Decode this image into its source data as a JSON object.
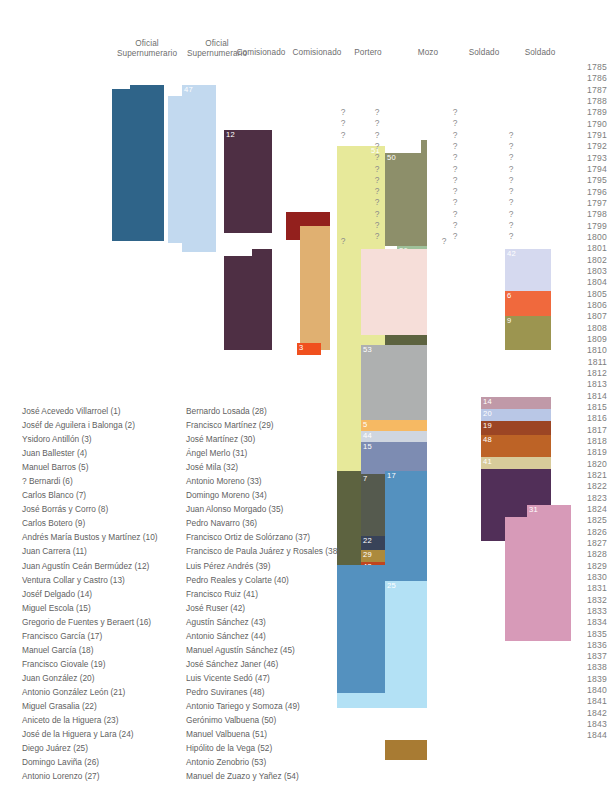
{
  "figure": {
    "type": "timeline-gantt",
    "year_axis": {
      "start": 1785,
      "end": 1844,
      "labels": [
        "1785",
        "1786",
        "1787",
        "1788",
        "1789",
        "1790",
        "1791",
        "1792",
        "1793",
        "1794",
        "1795",
        "1796",
        "1797",
        "1798",
        "1799",
        "1800",
        "1801",
        "1802",
        "1803",
        "1804",
        "1805",
        "1806",
        "1807",
        "1808",
        "1809",
        "1810",
        "1811",
        "1812",
        "1813",
        "1814",
        "1815",
        "1816",
        "1817",
        "1818",
        "1819",
        "1820",
        "1821",
        "1822",
        "1823",
        "1824",
        "1825",
        "1826",
        "1827",
        "1828",
        "1829",
        "1830",
        "1831",
        "1832",
        "1833",
        "1834",
        "1835",
        "1836",
        "1837",
        "1838",
        "1839",
        "1840",
        "1841",
        "1842",
        "1843",
        "1844"
      ]
    },
    "columns": [
      {
        "label": "Oficial\nSupernumerario"
      },
      {
        "label": "Oficial\nSupernumerario"
      },
      {
        "label": "Comisionado"
      },
      {
        "label": "Comisionado"
      },
      {
        "label": "Portero"
      },
      {
        "label": "Mozo"
      },
      {
        "label": "Soldado"
      },
      {
        "label": "Soldado"
      }
    ],
    "unknown_symbol": "?",
    "bars": [
      {
        "id": "36",
        "label": "36",
        "color": "#2f6489",
        "x": 112,
        "y": 89,
        "w": 52,
        "h": 152,
        "tx": 18,
        "ty": -7
      },
      {
        "id": "36b",
        "label": "",
        "color": "#2f6489",
        "x": 130,
        "y": 85,
        "w": 34,
        "h": 8,
        "tx": 0,
        "ty": 0
      },
      {
        "id": "47",
        "label": "47",
        "color": "#c2d9ef",
        "x": 182,
        "y": 85,
        "w": 34,
        "h": 167,
        "tx": 2,
        "ty": 0
      },
      {
        "id": "47b",
        "label": "",
        "color": "#c2d9ef",
        "x": 168,
        "y": 96,
        "w": 48,
        "h": 147,
        "tx": 0,
        "ty": 0
      },
      {
        "id": "12",
        "label": "12",
        "color": "#4e2f44",
        "x": 224,
        "y": 130,
        "w": 48,
        "h": 103,
        "tx": 2,
        "ty": 0
      },
      {
        "id": "12b",
        "label": "",
        "color": "#4e2f44",
        "x": 224,
        "y": 256,
        "w": 48,
        "h": 94,
        "tx": 0,
        "ty": 0
      },
      {
        "id": "12c",
        "label": "",
        "color": "#4e2f44",
        "x": 252,
        "y": 249,
        "w": 20,
        "h": 14,
        "tx": 0,
        "ty": 0
      },
      {
        "id": "1",
        "label": "1",
        "color": "#93201d",
        "x": 286,
        "y": 212,
        "w": 44,
        "h": 14,
        "tx": 2,
        "ty": 0
      },
      {
        "id": "1b",
        "label": "",
        "color": "#93201d",
        "x": 286,
        "y": 212,
        "w": 17,
        "h": 28,
        "tx": 0,
        "ty": 0
      },
      {
        "id": "49",
        "label": "49",
        "color": "#e0b071",
        "x": 300,
        "y": 226,
        "w": 30,
        "h": 124,
        "tx": 6,
        "ty": 0
      },
      {
        "id": "49b",
        "label": "",
        "color": "#e0b071",
        "x": 300,
        "y": 226,
        "w": 30,
        "h": 124,
        "tx": 0,
        "ty": 0
      },
      {
        "id": "3",
        "label": "3",
        "color": "#f0501e",
        "x": 297,
        "y": 343,
        "w": 24,
        "h": 12,
        "tx": 2,
        "ty": 0
      },
      {
        "id": "51",
        "label": "51",
        "color": "#e7e99a",
        "x": 337,
        "y": 146,
        "w": 48,
        "h": 327,
        "tx": 34,
        "ty": 0
      },
      {
        "id": "51b",
        "label": "",
        "color": "#e7e99a",
        "x": 337,
        "y": 153,
        "w": 26,
        "h": 320,
        "tx": 0,
        "ty": 0
      },
      {
        "id": "50",
        "label": "50",
        "color": "#8d8f6a",
        "x": 385,
        "y": 153,
        "w": 42,
        "h": 93,
        "tx": 2,
        "ty": 0
      },
      {
        "id": "50b",
        "label": "",
        "color": "#8d8f6a",
        "x": 421,
        "y": 140,
        "w": 6,
        "h": 14,
        "tx": 0,
        "ty": 0
      },
      {
        "id": "18",
        "label": "18",
        "color": "#9e3a76",
        "x": 385,
        "y": 252,
        "w": 12,
        "h": 12,
        "tx": 1,
        "ty": 0
      },
      {
        "id": "26",
        "label": "26",
        "color": "#9fc19a",
        "x": 397,
        "y": 246,
        "w": 30,
        "h": 34,
        "tx": 2,
        "ty": 0
      },
      {
        "id": "26b",
        "label": "",
        "color": "#9fc19a",
        "x": 385,
        "y": 263,
        "w": 42,
        "h": 18,
        "tx": 0,
        "ty": 0
      },
      {
        "id": "27",
        "label": "27",
        "color": "#5d6340",
        "x": 397,
        "y": 281,
        "w": 30,
        "h": 186,
        "tx": 2,
        "ty": 0
      },
      {
        "id": "27b",
        "label": "",
        "color": "#5d6340",
        "x": 385,
        "y": 290,
        "w": 42,
        "h": 177,
        "tx": 0,
        "ty": 0
      },
      {
        "id": "27c",
        "label": "",
        "color": "#5d6340",
        "x": 337,
        "y": 471,
        "w": 90,
        "h": 94,
        "tx": 0,
        "ty": 0
      },
      {
        "id": "53",
        "label": "53",
        "color": "#aeb0b0",
        "x": 361,
        "y": 345,
        "w": 66,
        "h": 75,
        "tx": 2,
        "ty": 0
      },
      {
        "id": "53b",
        "label": "",
        "color": "#f6ded9",
        "x": 361,
        "y": 249,
        "w": 66,
        "h": 86,
        "tx": 0,
        "ty": 0
      },
      {
        "id": "5",
        "label": "5",
        "color": "#f6b963",
        "x": 361,
        "y": 420,
        "w": 66,
        "h": 11,
        "tx": 2,
        "ty": 0
      },
      {
        "id": "44",
        "label": "44",
        "color": "#cfd6e0",
        "x": 361,
        "y": 431,
        "w": 66,
        "h": 11,
        "tx": 2,
        "ty": 0
      },
      {
        "id": "15",
        "label": "15",
        "color": "#7d8cb2",
        "x": 361,
        "y": 442,
        "w": 66,
        "h": 32,
        "tx": 2,
        "ty": 0
      },
      {
        "id": "7",
        "label": "7",
        "color": "#555a4e",
        "x": 361,
        "y": 474,
        "w": 66,
        "h": 75,
        "tx": 2,
        "ty": 0
      },
      {
        "id": "22",
        "label": "22",
        "color": "#384359",
        "x": 361,
        "y": 536,
        "w": 66,
        "h": 14,
        "tx": 2,
        "ty": 0
      },
      {
        "id": "29",
        "label": "29",
        "color": "#ac8a3d",
        "x": 361,
        "y": 550,
        "w": 66,
        "h": 12,
        "tx": 2,
        "ty": 0
      },
      {
        "id": "43",
        "label": "43",
        "color": "#c0451f",
        "x": 361,
        "y": 562,
        "w": 66,
        "h": 12,
        "tx": 2,
        "ty": 0
      },
      {
        "id": "30",
        "label": "30",
        "color": "#b6c0e0",
        "x": 361,
        "y": 574,
        "w": 66,
        "h": 11,
        "tx": 2,
        "ty": 0
      },
      {
        "id": "32",
        "label": "32",
        "color": "#6d3b41",
        "x": 361,
        "y": 585,
        "w": 66,
        "h": 52,
        "tx": 2,
        "ty": 0
      },
      {
        "id": "17",
        "label": "17",
        "color": "#5491bf",
        "x": 385,
        "y": 471,
        "w": 42,
        "h": 110,
        "tx": 2,
        "ty": 0
      },
      {
        "id": "17b",
        "label": "",
        "color": "#5491bf",
        "x": 337,
        "y": 565,
        "w": 90,
        "h": 130,
        "tx": 0,
        "ty": 0
      },
      {
        "id": "17c",
        "label": "",
        "color": "#5491bf",
        "x": 337,
        "y": 565,
        "w": 48,
        "h": 140,
        "tx": 0,
        "ty": 0
      },
      {
        "id": "25",
        "label": "25",
        "color": "#b3e1f5",
        "x": 385,
        "y": 581,
        "w": 42,
        "h": 127,
        "tx": 2,
        "ty": 0
      },
      {
        "id": "25b",
        "label": "",
        "color": "#b3e1f5",
        "x": 337,
        "y": 693,
        "w": 90,
        "h": 15,
        "tx": 0,
        "ty": 0
      },
      {
        "id": "4",
        "label": "4",
        "color": "#a87b33",
        "x": 385,
        "y": 740,
        "w": 42,
        "h": 20,
        "tx": 22,
        "ty": 0
      },
      {
        "id": "4b",
        "label": "",
        "color": "#a87b33",
        "x": 397,
        "y": 740,
        "w": 30,
        "h": 20,
        "tx": 0,
        "ty": 0
      },
      {
        "id": "42",
        "label": "42",
        "color": "#d5d9ef",
        "x": 505,
        "y": 249,
        "w": 46,
        "h": 50,
        "tx": 2,
        "ty": 0
      },
      {
        "id": "6",
        "label": "6",
        "color": "#f0693d",
        "x": 505,
        "y": 291,
        "w": 46,
        "h": 25,
        "tx": 2,
        "ty": 0
      },
      {
        "id": "9",
        "label": "9",
        "color": "#9c9550",
        "x": 505,
        "y": 316,
        "w": 46,
        "h": 34,
        "tx": 2,
        "ty": 0
      },
      {
        "id": "14",
        "label": "14",
        "color": "#c099a8",
        "x": 481,
        "y": 397,
        "w": 70,
        "h": 12,
        "tx": 2,
        "ty": 0
      },
      {
        "id": "20",
        "label": "20",
        "color": "#b9c7e6",
        "x": 481,
        "y": 409,
        "w": 70,
        "h": 12,
        "tx": 2,
        "ty": 0
      },
      {
        "id": "19",
        "label": "19",
        "color": "#9c4524",
        "x": 481,
        "y": 421,
        "w": 70,
        "h": 14,
        "tx": 2,
        "ty": 0
      },
      {
        "id": "48",
        "label": "48",
        "color": "#bd6326",
        "x": 481,
        "y": 435,
        "w": 70,
        "h": 22,
        "tx": 2,
        "ty": 0
      },
      {
        "id": "41",
        "label": "41",
        "color": "#d8cb9a",
        "x": 481,
        "y": 457,
        "w": 70,
        "h": 12,
        "tx": 2,
        "ty": 0
      },
      {
        "id": "34",
        "label": "34",
        "color": "#512f58",
        "x": 481,
        "y": 469,
        "w": 70,
        "h": 48,
        "tx": 2,
        "ty": 0
      },
      {
        "id": "34b",
        "label": "",
        "color": "#512f58",
        "x": 481,
        "y": 469,
        "w": 46,
        "h": 72,
        "tx": 0,
        "ty": 0
      },
      {
        "id": "31",
        "label": "31",
        "color": "#d79ab8",
        "x": 527,
        "y": 505,
        "w": 44,
        "h": 136,
        "tx": 2,
        "ty": 0
      },
      {
        "id": "31b",
        "label": "",
        "color": "#d79ab8",
        "x": 505,
        "y": 517,
        "w": 66,
        "h": 124,
        "tx": 0,
        "ty": 0
      }
    ],
    "unknown_marks": [
      {
        "x": 338,
        "y": 107
      },
      {
        "x": 338,
        "y": 118
      },
      {
        "x": 338,
        "y": 130
      },
      {
        "x": 372,
        "y": 107
      },
      {
        "x": 372,
        "y": 118
      },
      {
        "x": 372,
        "y": 130
      },
      {
        "x": 372,
        "y": 141
      },
      {
        "x": 372,
        "y": 152
      },
      {
        "x": 372,
        "y": 164
      },
      {
        "x": 372,
        "y": 175
      },
      {
        "x": 372,
        "y": 186
      },
      {
        "x": 372,
        "y": 197
      },
      {
        "x": 372,
        "y": 209
      },
      {
        "x": 372,
        "y": 220
      },
      {
        "x": 372,
        "y": 231
      },
      {
        "x": 338,
        "y": 236
      },
      {
        "x": 450,
        "y": 107
      },
      {
        "x": 450,
        "y": 118
      },
      {
        "x": 450,
        "y": 130
      },
      {
        "x": 450,
        "y": 141
      },
      {
        "x": 450,
        "y": 152
      },
      {
        "x": 450,
        "y": 164
      },
      {
        "x": 450,
        "y": 175
      },
      {
        "x": 450,
        "y": 186
      },
      {
        "x": 450,
        "y": 197
      },
      {
        "x": 450,
        "y": 209
      },
      {
        "x": 450,
        "y": 220
      },
      {
        "x": 450,
        "y": 231
      },
      {
        "x": 506,
        "y": 130
      },
      {
        "x": 506,
        "y": 141
      },
      {
        "x": 506,
        "y": 152
      },
      {
        "x": 506,
        "y": 164
      },
      {
        "x": 506,
        "y": 175
      },
      {
        "x": 506,
        "y": 186
      },
      {
        "x": 506,
        "y": 197
      },
      {
        "x": 506,
        "y": 209
      },
      {
        "x": 506,
        "y": 220
      },
      {
        "x": 506,
        "y": 231
      },
      {
        "x": 439,
        "y": 236
      }
    ]
  },
  "legend": {
    "column1": [
      "José Acevedo Villarroel (1)",
      "Joséf de Aguilera i Balonga (2)",
      "Ysidoro Antillón (3)",
      "Juan Ballester (4)",
      "Manuel Barros (5)",
      "? Bernardi (6)",
      "Carlos Blanco (7)",
      "José Borrás y Corro (8)",
      "Carlos Botero (9)",
      "Andrés María Bustos y Martínez (10)",
      "Juan Carrera (11)",
      "Juan Agustín Ceán Bermúdez (12)",
      "Ventura Collar y Castro (13)",
      "Joséf Delgado (14)",
      "Miguel Escola (15)",
      "Gregorio de Fuentes y Beraert (16)",
      "Francisco García (17)",
      "Manuel García (18)",
      "Francisco Giovale (19)",
      "Juan González (20)",
      "Antonio González León (21)",
      "Miguel Grasalia (22)",
      "Aniceto de la Higuera (23)",
      "José de la Higuera y Lara (24)",
      "Diego Juárez (25)",
      "Domingo Laviña (26)",
      "Antonio Lorenzo (27)"
    ],
    "column2": [
      "Bernardo Losada (28)",
      "Francisco Martínez (29)",
      "José Martínez (30)",
      "Ángel Merlo (31)",
      "José Mila (32)",
      "Antonio Moreno (33)",
      "Domingo Moreno (34)",
      "Juan Alonso Morgado (35)",
      "Pedro Navarro (36)",
      "Francisco Ortiz de Solórzano (37)",
      "Francisco de Paula Juárez y Rosales (38)",
      "Luis Pérez Andrés (39)",
      "Pedro Reales y Colarte (40)",
      "Francisco Ruiz (41)",
      "José Ruser (42)",
      "Agustín Sánchez (43)",
      "Antonio Sánchez (44)",
      "Manuel Agustín Sánchez (45)",
      "José Sánchez Janer (46)",
      "Luis Vicente Sedó (47)",
      "Pedro Suviranes (48)",
      "Antonio Tariego y Somoza (49)",
      "Gerónimo Valbuena (50)",
      "Manuel Valbuena (51)",
      "Hipólito de la Vega (52)",
      "Antonio Zenobrio (53)",
      "Manuel de Zuazo y Yañez (54)"
    ]
  }
}
